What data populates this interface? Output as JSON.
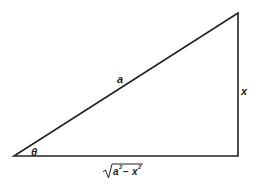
{
  "diagram": {
    "type": "right-triangle",
    "labels": {
      "hypotenuse": "a",
      "opposite": "x",
      "angle": "θ",
      "adjacent_radicand_a": "a",
      "adjacent_radicand_a_exp": "2",
      "adjacent_minus": "−",
      "adjacent_radicand_x": "x",
      "adjacent_radicand_x_exp": "2"
    },
    "vertices": {
      "angle_vertex": [
        14,
        156
      ],
      "right_angle_vertex": [
        238,
        156
      ],
      "top_vertex": [
        238,
        13
      ]
    },
    "stroke_color": "#222222"
  }
}
